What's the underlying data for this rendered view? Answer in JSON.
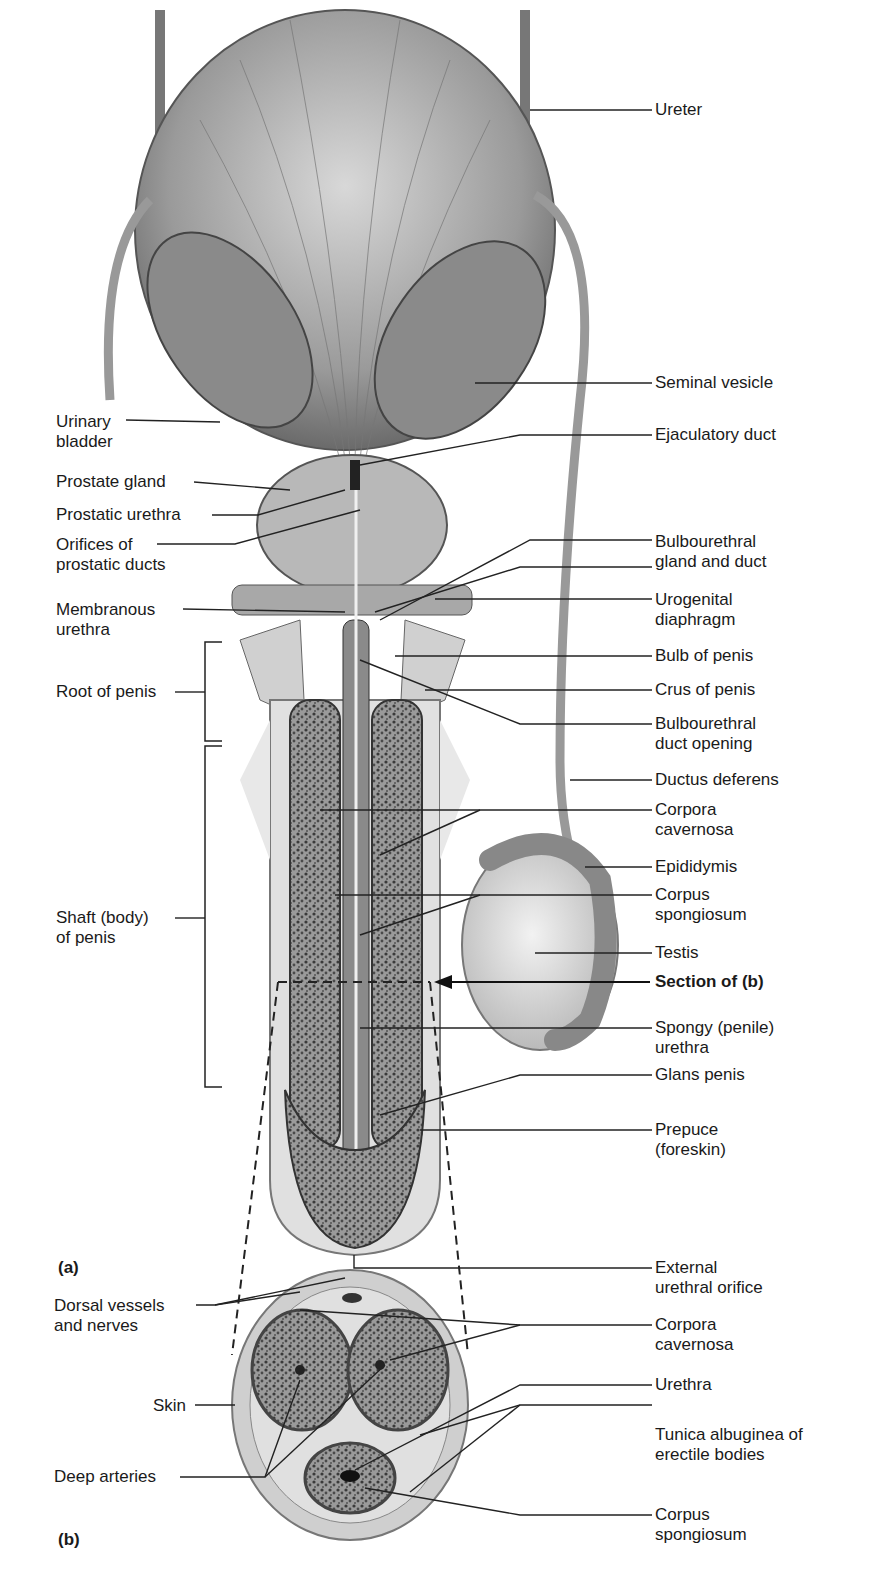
{
  "figure": {
    "panel_a_label": "(a)",
    "panel_b_label": "(b)"
  },
  "left_labels": [
    {
      "text": "Urinary\nbladder",
      "line1": "Urinary",
      "line2": "bladder"
    },
    {
      "line1": "Prostate gland"
    },
    {
      "line1": "Prostatic urethra"
    },
    {
      "line1": "Orifices of",
      "line2": "prostatic ducts"
    },
    {
      "line1": "Membranous",
      "line2": "urethra"
    },
    {
      "line1": "Root of penis"
    },
    {
      "line1": "Shaft (body)",
      "line2": "of penis"
    },
    {
      "line1": "Dorsal vessels",
      "line2": "and nerves"
    },
    {
      "line1": "Skin"
    },
    {
      "line1": "Deep arteries"
    }
  ],
  "right_labels": [
    {
      "line1": "Ureter"
    },
    {
      "line1": "Seminal vesicle"
    },
    {
      "line1": "Ejaculatory duct"
    },
    {
      "line1": "Bulbourethral",
      "line2": "gland and duct"
    },
    {
      "line1": "Urogenital",
      "line2": "diaphragm"
    },
    {
      "line1": "Bulb of penis"
    },
    {
      "line1": "Crus of penis"
    },
    {
      "line1": "Bulbourethral",
      "line2": "duct opening"
    },
    {
      "line1": "Ductus deferens"
    },
    {
      "line1": "Corpora",
      "line2": "cavernosa"
    },
    {
      "line1": "Epididymis"
    },
    {
      "line1": "Corpus",
      "line2": "spongiosum"
    },
    {
      "line1": "Testis"
    },
    {
      "line1": "Section of (b)"
    },
    {
      "line1": "Spongy (penile)",
      "line2": "urethra"
    },
    {
      "line1": "Glans penis"
    },
    {
      "line1": "Prepuce",
      "line2": "(foreskin)"
    },
    {
      "line1": "External",
      "line2": "urethral orifice"
    },
    {
      "line1": "Corpora",
      "line2": "cavernosa"
    },
    {
      "line1": "Urethra"
    },
    {
      "line1": "Tunica albuginea of",
      "line2": "erectile bodies"
    },
    {
      "line1": "Corpus",
      "line2": "spongiosum"
    }
  ]
}
